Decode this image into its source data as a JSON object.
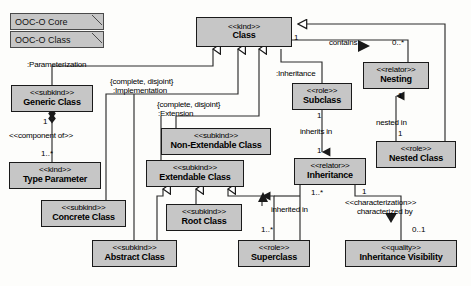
{
  "diagram": {
    "fill_color": "#c6c6c6",
    "stroke_color": "#1a1a1a",
    "background_color": "#fdfdfb"
  },
  "packages": [
    {
      "label": "OOC-O Core",
      "x": 10,
      "y": 13,
      "w": 94,
      "h": 17
    },
    {
      "label": "OOC-O Class",
      "x": 10,
      "y": 31,
      "w": 94,
      "h": 17
    }
  ],
  "classes": [
    {
      "id": "class",
      "stereotype": "<<kind>>",
      "name": "Class",
      "x": 196,
      "y": 17,
      "w": 96,
      "h": 30
    },
    {
      "id": "generic-class",
      "stereotype": "<<subkind>>",
      "name": "Generic Class",
      "x": 11,
      "y": 85,
      "w": 82,
      "h": 27
    },
    {
      "id": "type-parameter",
      "stereotype": "<<kind>>",
      "name": "Type Parameter",
      "x": 9,
      "y": 162,
      "w": 92,
      "h": 27
    },
    {
      "id": "concrete-class",
      "stereotype": "<<subkind>>",
      "name": "Concrete Class",
      "x": 41,
      "y": 200,
      "w": 85,
      "h": 27
    },
    {
      "id": "abstract-class",
      "stereotype": "<<subkind>>",
      "name": "Abstract Class",
      "x": 92,
      "y": 240,
      "w": 85,
      "h": 27
    },
    {
      "id": "non-extendable",
      "stereotype": "<<subkind>>",
      "name": "Non-Extendable Class",
      "x": 161,
      "y": 128,
      "w": 110,
      "h": 27
    },
    {
      "id": "extendable-class",
      "stereotype": "<<subkind>>",
      "name": "Extendable Class",
      "x": 146,
      "y": 160,
      "w": 98,
      "h": 27
    },
    {
      "id": "root-class",
      "stereotype": "<<subkind>>",
      "name": "Root Class",
      "x": 166,
      "y": 204,
      "w": 76,
      "h": 27
    },
    {
      "id": "superclass",
      "stereotype": "<<role>>",
      "name": "Superclass",
      "x": 238,
      "y": 240,
      "w": 72,
      "h": 27
    },
    {
      "id": "subclass",
      "stereotype": "<<role>>",
      "name": "Subclass",
      "x": 292,
      "y": 83,
      "w": 60,
      "h": 27
    },
    {
      "id": "inheritance",
      "stereotype": "<<relator>>",
      "name": "Inheritance",
      "x": 294,
      "y": 158,
      "w": 72,
      "h": 27
    },
    {
      "id": "nesting",
      "stereotype": "<<relator>>",
      "name": "Nesting",
      "x": 363,
      "y": 62,
      "w": 66,
      "h": 27
    },
    {
      "id": "nested-class",
      "stereotype": "<<role>>",
      "name": "Nested Class",
      "x": 376,
      "y": 141,
      "w": 80,
      "h": 27
    },
    {
      "id": "inh-visibility",
      "stereotype": "<<quality>>",
      "name": "Inheritance Visibility",
      "x": 345,
      "y": 240,
      "w": 112,
      "h": 27
    }
  ],
  "relationship_labels": [
    {
      "id": "parameterization",
      "text": ":Parameterization",
      "x": 27,
      "y": 60
    },
    {
      "id": "impl-constraint",
      "text": "{complete, disjoint}",
      "x": 110,
      "y": 77
    },
    {
      "id": "implementation",
      "text": ":Implementation",
      "x": 113,
      "y": 86
    },
    {
      "id": "ext-constraint",
      "text": "{complete, disjoint}",
      "x": 157,
      "y": 100
    },
    {
      "id": "extension",
      "text": ":Extension",
      "x": 158,
      "y": 109
    },
    {
      "id": "inheritance-assoc",
      "text": ":Inheritance",
      "x": 276,
      "y": 69
    },
    {
      "id": "contains",
      "text": "contains",
      "x": 329,
      "y": 44
    },
    {
      "id": "component-of",
      "text": "<<component of>>",
      "x": 9,
      "y": 132
    },
    {
      "id": "inherits-in",
      "text": "inherits in",
      "x": 303,
      "y": 128
    },
    {
      "id": "inherited-in",
      "text": "inherited in",
      "x": 273,
      "y": 208
    },
    {
      "id": "nested-in",
      "text": "nested in",
      "x": 380,
      "y": 120
    },
    {
      "id": "characterization",
      "text": "<<characterization>>",
      "x": 349,
      "y": 200
    },
    {
      "id": "characterized-by",
      "text": "characterized by",
      "x": 360,
      "y": 209
    }
  ],
  "multiplicities": [
    {
      "id": "class-contains-1",
      "text": "1",
      "x": 294,
      "y": 34
    },
    {
      "id": "nesting-0star",
      "text": "0..*",
      "x": 396,
      "y": 44
    },
    {
      "id": "generic-composite-1",
      "text": "1",
      "x": 46,
      "y": 119
    },
    {
      "id": "type-param-1star",
      "text": "1..*",
      "x": 44,
      "y": 150
    },
    {
      "id": "subclass-1",
      "text": "1",
      "x": 316,
      "y": 113
    },
    {
      "id": "inheritance-sub-1",
      "text": "1",
      "x": 316,
      "y": 147
    },
    {
      "id": "nesting-1",
      "text": "1",
      "x": 399,
      "y": 93
    },
    {
      "id": "nested-class-1",
      "text": "1",
      "x": 399,
      "y": 130
    },
    {
      "id": "inheritance-super-1star",
      "text": "1..*",
      "x": 314,
      "y": 190
    },
    {
      "id": "superclass-1star",
      "text": "1..*",
      "x": 264,
      "y": 227
    },
    {
      "id": "inheritance-quality-1",
      "text": "1",
      "x": 364,
      "y": 189
    },
    {
      "id": "visibility-01",
      "text": "0..1",
      "x": 416,
      "y": 227
    }
  ]
}
